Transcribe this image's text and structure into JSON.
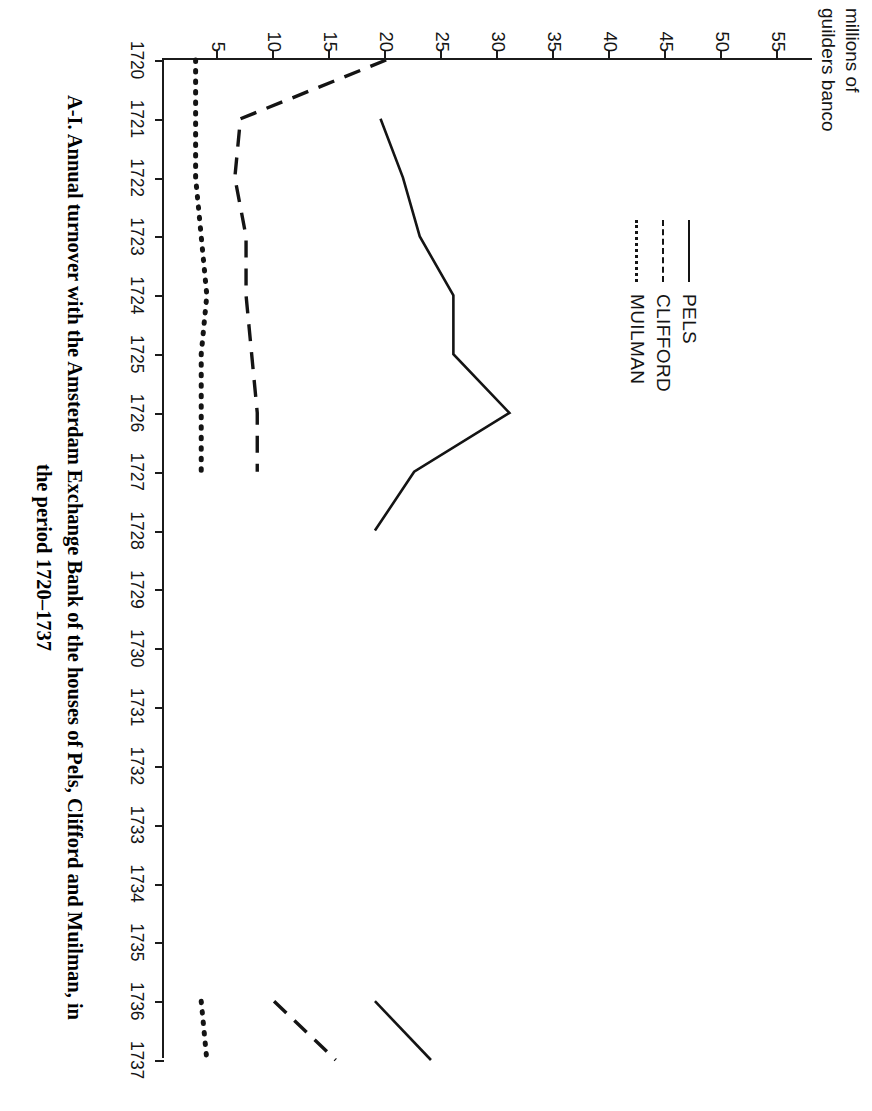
{
  "figure": {
    "caption_line_1": "A-I. Annual turnover with the Amsterdam Exchange Bank of the houses of Pels, Clifford and Muilman, in",
    "caption_line_2": "the period 1720–1737",
    "axis_title": "millions of\nguilders banco"
  },
  "legend": {
    "items": [
      {
        "label": "PELS",
        "style": "solid"
      },
      {
        "label": "CLIFFORD",
        "style": "dashed"
      },
      {
        "label": "MUILMAN",
        "style": "dotted"
      }
    ]
  },
  "chart_data": {
    "type": "line",
    "title": "A-I. Annual turnover with the Amsterdam Exchange Bank of the houses of Pels, Clifford and Muilman, in the period 1720–1737",
    "xlabel": "",
    "ylabel": "millions of guilders banco",
    "orientation": "rotated-90-clockwise",
    "grid": false,
    "legend_position": "inside-upper-left",
    "x": [
      1720,
      1721,
      1722,
      1723,
      1724,
      1725,
      1726,
      1727,
      1728,
      1729,
      1730,
      1731,
      1732,
      1733,
      1734,
      1735,
      1736,
      1737
    ],
    "xtick_labels": [
      "1720",
      "1721",
      "1722",
      "1723",
      "1724",
      "1725",
      "1726",
      "1727",
      "1728",
      "1729",
      "1730",
      "1731",
      "1732",
      "1733",
      "1734",
      "1735",
      "1736",
      "1737"
    ],
    "ytick_labels": [
      "5",
      "10",
      "15",
      "20",
      "25",
      "30",
      "35",
      "40",
      "45",
      "50",
      "55"
    ],
    "yticks": [
      5,
      10,
      15,
      20,
      25,
      30,
      35,
      40,
      45,
      50,
      55
    ],
    "xlim": [
      1720,
      1737
    ],
    "ylim": [
      0,
      58
    ],
    "series": [
      {
        "name": "PELS",
        "style": "solid",
        "color": "#141414",
        "x": [
          1721,
          1722,
          1723,
          1724,
          1725,
          1726,
          1727,
          1728,
          1736,
          1737
        ],
        "values": [
          19.5,
          21.5,
          23.0,
          26.0,
          26.0,
          31.0,
          22.5,
          19.0,
          19.0,
          24.0
        ]
      },
      {
        "name": "CLIFFORD",
        "style": "dashed",
        "color": "#141414",
        "x": [
          1720,
          1721,
          1722,
          1723,
          1724,
          1725,
          1726,
          1727,
          1736,
          1737
        ],
        "values": [
          20.0,
          7.0,
          6.5,
          7.5,
          7.5,
          8.0,
          8.5,
          8.5,
          10.0,
          15.5
        ]
      },
      {
        "name": "MUILMAN",
        "style": "dotted",
        "color": "#141414",
        "x": [
          1720,
          1721,
          1722,
          1723,
          1724,
          1725,
          1726,
          1727,
          1736,
          1737
        ],
        "values": [
          3.0,
          3.0,
          3.0,
          3.5,
          4.0,
          3.5,
          3.5,
          3.5,
          3.5,
          4.0
        ]
      }
    ]
  }
}
